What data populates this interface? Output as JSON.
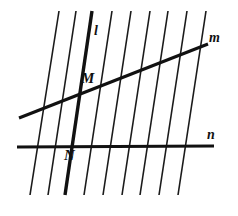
{
  "figure": {
    "canvas": {
      "width": 238,
      "height": 216,
      "background": "#ffffff"
    },
    "stroke_color": "#111111",
    "labels": {
      "line_l": "l",
      "line_m": "m",
      "line_n": "n",
      "point_M": "M",
      "point_N": "N"
    },
    "parallel_lines": [
      {
        "x_top": 59,
        "y_top": 11,
        "x_bottom": 30,
        "y_bottom": 195,
        "bold": false
      },
      {
        "x_top": 76,
        "y_top": 11,
        "x_bottom": 48,
        "y_bottom": 195,
        "bold": false
      },
      {
        "x_top": 92,
        "y_top": 11,
        "x_bottom": 65,
        "y_bottom": 195,
        "bold": true
      },
      {
        "x_top": 112,
        "y_top": 11,
        "x_bottom": 84,
        "y_bottom": 195,
        "bold": false
      },
      {
        "x_top": 131,
        "y_top": 11,
        "x_bottom": 103,
        "y_bottom": 195,
        "bold": false
      },
      {
        "x_top": 150,
        "y_top": 11,
        "x_bottom": 122,
        "y_bottom": 195,
        "bold": false
      },
      {
        "x_top": 168,
        "y_top": 11,
        "x_bottom": 140,
        "y_bottom": 195,
        "bold": false
      },
      {
        "x_top": 187,
        "y_top": 11,
        "x_bottom": 159,
        "y_bottom": 195,
        "bold": false
      },
      {
        "x_top": 206,
        "y_top": 11,
        "x_bottom": 178,
        "y_bottom": 195,
        "bold": false
      }
    ],
    "transversal_m": {
      "x1": 19,
      "y1": 118,
      "x2": 208,
      "y2": 44
    },
    "transversal_n": {
      "x1": 17,
      "y1": 147,
      "x2": 214,
      "y2": 146
    },
    "intersection_M": {
      "x": 87,
      "y": 87
    },
    "intersection_N": {
      "x": 73,
      "y": 147
    }
  }
}
